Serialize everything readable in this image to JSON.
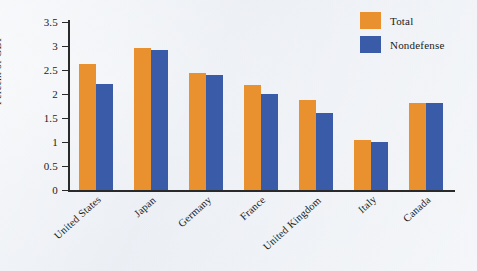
{
  "chart_data": {
    "type": "bar",
    "title": "",
    "xlabel": "",
    "ylabel": "Percent of GDP",
    "ylim": [
      0,
      3.5
    ],
    "ytick_labels": [
      "3.5",
      "3",
      "2.5",
      "2",
      "1.5",
      "1",
      "0.5",
      "0"
    ],
    "ytick_values": [
      3.5,
      3,
      2.5,
      2,
      1.5,
      1,
      0.5,
      0
    ],
    "grid": false,
    "legend_position": "top-right",
    "categories": [
      "United States",
      "Japan",
      "Germany",
      "France",
      "United Kingdom",
      "Italy",
      "Canada"
    ],
    "series": [
      {
        "name": "Total",
        "color": "#e8912e",
        "values": [
          2.63,
          2.96,
          2.44,
          2.19,
          1.88,
          1.04,
          1.81
        ]
      },
      {
        "name": "Nondefense",
        "color": "#3a5ba8",
        "values": [
          2.21,
          2.91,
          2.4,
          2.0,
          1.6,
          1.0,
          1.81
        ]
      }
    ]
  },
  "legend": {
    "items": [
      {
        "label": "Total",
        "color": "#e8912e"
      },
      {
        "label": "Nondefense",
        "color": "#3a5ba8"
      }
    ]
  },
  "axis": {
    "y_label": "Percent of GDP"
  },
  "colors": {
    "total": "#e8912e",
    "nondefense": "#3a5ba8",
    "axis": "#2a2a2a",
    "background": "#eceff4"
  }
}
